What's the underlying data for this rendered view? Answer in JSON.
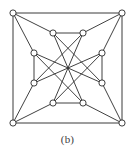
{
  "figure": {
    "caption": "(b)",
    "label": "b",
    "type": "undirected-graph-drawing",
    "background_color": "#ffffff",
    "edge_color": "#2b2b2b",
    "vertex_fill_color": "#ffffff",
    "vertex_stroke_color": "#2b2b2b",
    "vertex_count": 12,
    "edge_count": 24,
    "vertex_radius": 3.1
  },
  "graph": {
    "vertices": [
      {
        "id": "c-tl",
        "name": "corner-top-left",
        "x": 13,
        "y": 13,
        "group": "outer-square"
      },
      {
        "id": "c-tr",
        "name": "corner-top-right",
        "x": 122,
        "y": 13,
        "group": "outer-square"
      },
      {
        "id": "c-br",
        "name": "corner-bottom-right",
        "x": 122,
        "y": 123,
        "group": "outer-square"
      },
      {
        "id": "c-bl",
        "name": "corner-bottom-left",
        "x": 13,
        "y": 123,
        "group": "outer-square"
      },
      {
        "id": "i-tl",
        "name": "inner-top-left",
        "x": 53,
        "y": 33,
        "group": "inner-octagon"
      },
      {
        "id": "i-tr",
        "name": "inner-top-right",
        "x": 83,
        "y": 33,
        "group": "inner-octagon"
      },
      {
        "id": "i-rt",
        "name": "inner-right-top",
        "x": 102,
        "y": 53,
        "group": "inner-octagon"
      },
      {
        "id": "i-rb",
        "name": "inner-right-bottom",
        "x": 102,
        "y": 83,
        "group": "inner-octagon"
      },
      {
        "id": "i-br",
        "name": "inner-bottom-right",
        "x": 83,
        "y": 103,
        "group": "inner-octagon"
      },
      {
        "id": "i-bl",
        "name": "inner-bottom-left",
        "x": 53,
        "y": 103,
        "group": "inner-octagon"
      },
      {
        "id": "i-lb",
        "name": "inner-left-bottom",
        "x": 34,
        "y": 83,
        "group": "inner-octagon"
      },
      {
        "id": "i-lt",
        "name": "inner-left-top",
        "x": 34,
        "y": 53,
        "group": "inner-octagon"
      }
    ],
    "edges": [
      {
        "from": "c-tl",
        "to": "c-tr",
        "kind": "outer-square-side"
      },
      {
        "from": "c-tr",
        "to": "c-br",
        "kind": "outer-square-side"
      },
      {
        "from": "c-br",
        "to": "c-bl",
        "kind": "outer-square-side"
      },
      {
        "from": "c-bl",
        "to": "c-tl",
        "kind": "outer-square-side"
      },
      {
        "from": "i-tl",
        "to": "i-tr",
        "kind": "inner-square-side"
      },
      {
        "from": "i-rt",
        "to": "i-rb",
        "kind": "inner-square-side"
      },
      {
        "from": "i-br",
        "to": "i-bl",
        "kind": "inner-square-side"
      },
      {
        "from": "i-lb",
        "to": "i-lt",
        "kind": "inner-square-side"
      },
      {
        "from": "c-tl",
        "to": "i-tl",
        "kind": "spoke"
      },
      {
        "from": "c-tl",
        "to": "i-lt",
        "kind": "spoke"
      },
      {
        "from": "c-tr",
        "to": "i-tr",
        "kind": "spoke"
      },
      {
        "from": "c-tr",
        "to": "i-rt",
        "kind": "spoke"
      },
      {
        "from": "c-br",
        "to": "i-rb",
        "kind": "spoke"
      },
      {
        "from": "c-br",
        "to": "i-br",
        "kind": "spoke"
      },
      {
        "from": "c-bl",
        "to": "i-bl",
        "kind": "spoke"
      },
      {
        "from": "c-bl",
        "to": "i-lb",
        "kind": "spoke"
      },
      {
        "from": "i-tl",
        "to": "i-rb",
        "kind": "star-chord"
      },
      {
        "from": "i-tl",
        "to": "i-br",
        "kind": "star-chord"
      },
      {
        "from": "i-tr",
        "to": "i-lb",
        "kind": "star-chord"
      },
      {
        "from": "i-tr",
        "to": "i-bl",
        "kind": "star-chord"
      },
      {
        "from": "i-rt",
        "to": "i-bl",
        "kind": "star-chord"
      },
      {
        "from": "i-rt",
        "to": "i-lb",
        "kind": "star-chord"
      },
      {
        "from": "i-lt",
        "to": "i-br",
        "kind": "star-chord"
      },
      {
        "from": "i-lt",
        "to": "i-rb",
        "kind": "star-chord"
      }
    ]
  }
}
